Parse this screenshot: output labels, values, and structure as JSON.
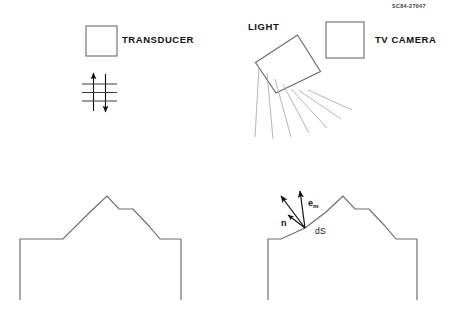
{
  "figure": {
    "corner_code": "SC84-27047",
    "background_color": "#ffffff",
    "line_color": "#555555",
    "vector_color": "#111111",
    "ray_color": "#9a9a9a",
    "width": 449,
    "height": 309
  },
  "panels": {
    "top_left": {
      "label": "TRANSDUCER",
      "icon_name": "transducer-box",
      "wave_symbol_name": "ultrasonic-wave-symbol",
      "wave_arrow_up_name": "wave-arrow-up",
      "wave_arrow_down_name": "wave-arrow-down",
      "wave_line_count": 3
    },
    "top_right": {
      "light_label": "LIGHT",
      "camera_label": "TV CAMERA",
      "light_source_name": "tilted-light-source-box",
      "camera_name": "tv-camera-box",
      "ray_count": 7
    },
    "bottom_left": {
      "name": "rough-surface-profile-plain",
      "block_name": "substrate-block"
    },
    "bottom_right": {
      "name": "rough-surface-profile-vectors",
      "block_name": "substrate-block",
      "area_label": "dS",
      "vectors": [
        {
          "id": "reflected-ray-vector",
          "symbol": "",
          "subscript": "",
          "has_overbar": false,
          "angle_label": "up-left"
        },
        {
          "id": "em-vector",
          "symbol": "e",
          "subscript": "m",
          "has_overbar": true,
          "angle_label": "up"
        },
        {
          "id": "n-normal-vector",
          "symbol": "n",
          "subscript": "",
          "has_overbar": true,
          "angle_label": "up-left-shallow"
        }
      ]
    }
  }
}
